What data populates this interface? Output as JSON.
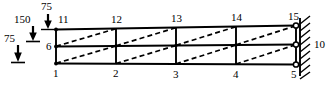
{
  "diagram": {
    "type": "structural-frame",
    "colors": {
      "member": "#000000",
      "brace": "#000000",
      "background": "#ffffff",
      "text": "#000000"
    },
    "loads": [
      {
        "id": "load-top",
        "value": "75",
        "direction": "down",
        "applied_at": "11"
      },
      {
        "id": "load-middle",
        "value": "150",
        "direction": "down",
        "applied_at": "6"
      },
      {
        "id": "load-bottom",
        "value": "75",
        "direction": "down",
        "applied_at": "1"
      }
    ],
    "nodes": {
      "top": [
        "11",
        "12",
        "13",
        "14",
        "15"
      ],
      "middle": [
        "6",
        "10"
      ],
      "bottom": [
        "1",
        "2",
        "3",
        "4",
        "5"
      ]
    },
    "support": {
      "type": "fixed-wall",
      "side": "right",
      "nodes": [
        "15",
        "10",
        "5"
      ]
    },
    "bays": 4,
    "stories": 2,
    "braces": {
      "style": "dashed",
      "orientation": "lower-left-to-upper-right",
      "count_per_panel": 1,
      "total": 8
    }
  }
}
